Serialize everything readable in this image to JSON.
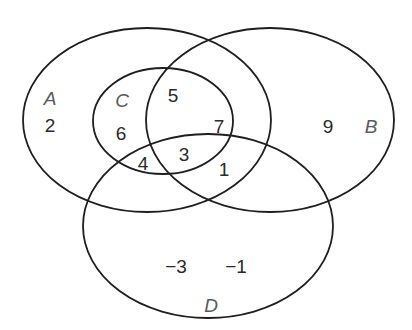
{
  "diagram": {
    "type": "venn",
    "sets": [
      {
        "id": "A",
        "label": "A",
        "ellipse": {
          "cx": 147,
          "cy": 120,
          "rx": 124,
          "ry": 92
        },
        "label_pos": [
          50,
          98
        ]
      },
      {
        "id": "B",
        "label": "B",
        "ellipse": {
          "cx": 270,
          "cy": 120,
          "rx": 124,
          "ry": 92
        },
        "label_pos": [
          371,
          126
        ]
      },
      {
        "id": "C",
        "label": "C",
        "ellipse": {
          "cx": 163,
          "cy": 121,
          "rx": 70,
          "ry": 53
        },
        "label_pos": [
          122,
          100
        ]
      },
      {
        "id": "D",
        "label": "D",
        "ellipse": {
          "cx": 208,
          "cy": 226,
          "rx": 125,
          "ry": 92
        },
        "label_pos": [
          211,
          305
        ]
      }
    ],
    "regions": [
      {
        "value": "2",
        "in": [
          "A"
        ],
        "pos": [
          50,
          125
        ]
      },
      {
        "value": "6",
        "in": [
          "A",
          "C"
        ],
        "pos": [
          121,
          133
        ]
      },
      {
        "value": "5",
        "in": [
          "A",
          "B",
          "C"
        ],
        "pos": [
          173,
          95
        ]
      },
      {
        "value": "7",
        "in": [
          "A",
          "B",
          "C"
        ],
        "pos": [
          219,
          126
        ]
      },
      {
        "value": "4",
        "in": [
          "A",
          "C",
          "D"
        ],
        "pos": [
          143,
          163
        ]
      },
      {
        "value": "3",
        "in": [
          "A",
          "B",
          "C",
          "D"
        ],
        "pos": [
          184,
          154
        ]
      },
      {
        "value": "1",
        "in": [
          "A",
          "B",
          "D"
        ],
        "pos": [
          224,
          169
        ]
      },
      {
        "value": "9",
        "in": [
          "B"
        ],
        "pos": [
          328,
          126
        ]
      },
      {
        "value": "−3",
        "in": [
          "D"
        ],
        "pos": [
          176,
          266
        ]
      },
      {
        "value": "−1",
        "in": [
          "D"
        ],
        "pos": [
          236,
          266
        ]
      }
    ],
    "stroke_color": "#1e1e1e",
    "text_color": "#2a2a2a",
    "set_label_color": "#5a5a5a"
  }
}
